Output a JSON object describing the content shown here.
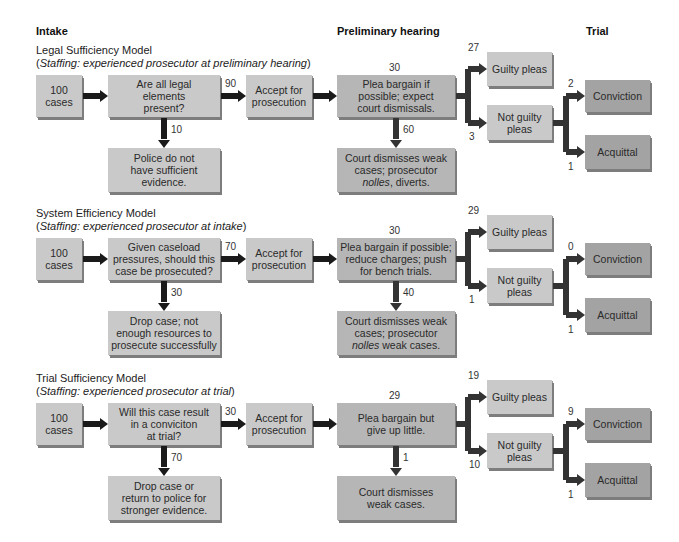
{
  "headers": {
    "intake": "Intake",
    "preliminary": "Preliminary hearing",
    "trial": "Trial"
  },
  "models": [
    {
      "title": "Legal Sufficiency Model",
      "staffing_prefix": "(",
      "staffing_label": "Staffing:",
      "staffing_text": " experienced prosecutor at preliminary hearing",
      "staffing_suffix": ")",
      "start": "100 cases",
      "question": "Are all legal elements present?",
      "question_lines": [
        "Are all legal",
        "elements",
        "present?"
      ],
      "accept_count": "90",
      "reject_count": "10",
      "reject_lines": [
        "Police do not",
        "have sufficient",
        "evidence."
      ],
      "accept_lines": [
        "Accept for",
        "prosecution"
      ],
      "plea_count": "30",
      "plea_lines": [
        "Plea bargain if",
        "possible; expect",
        "court dismissals."
      ],
      "dismiss_count": "60",
      "dismiss_lines": [
        "Court dismisses weak",
        "cases; prosecutor",
        "nolles, diverts."
      ],
      "guilty_count": "27",
      "guilty_label": "Guilty pleas",
      "notguilty_count": "3",
      "notguilty_lines": [
        "Not guilty",
        "pleas"
      ],
      "conviction_count": "2",
      "conviction_label": "Conviction",
      "acquittal_count": "1",
      "acquittal_label": "Acquittal"
    },
    {
      "title": "System Efficiency Model",
      "staffing_prefix": "(",
      "staffing_label": "Staffing:",
      "staffing_text": " experienced prosecutor at intake",
      "staffing_suffix": ")",
      "start": "100 cases",
      "question_lines": [
        "Given caseload",
        "pressures, should this",
        "case be prosecuted?"
      ],
      "accept_count": "70",
      "reject_count": "30",
      "reject_lines": [
        "Drop case; not",
        "enough resources to",
        "prosecute successfully"
      ],
      "accept_lines": [
        "Accept for",
        "prosecution"
      ],
      "plea_count": "30",
      "plea_lines": [
        "Plea bargain if possible;",
        "reduce charges; push",
        "for bench trials."
      ],
      "dismiss_count": "40",
      "dismiss_lines": [
        "Court dismisses weak",
        "cases; prosecutor",
        "nolles weak cases."
      ],
      "guilty_count": "29",
      "guilty_label": "Guilty pleas",
      "notguilty_count": "1",
      "notguilty_lines": [
        "Not guilty",
        "pleas"
      ],
      "conviction_count": "0",
      "conviction_label": "Conviction",
      "acquittal_count": "1",
      "acquittal_label": "Acquittal"
    },
    {
      "title": "Trial Sufficiency Model",
      "staffing_prefix": "(",
      "staffing_label": "Staffing:",
      "staffing_text": " experienced prosecutor at trial",
      "staffing_suffix": ")",
      "start": "100 cases",
      "question_lines": [
        "Will this case result",
        "in a conviciton",
        "at trial?"
      ],
      "accept_count": "30",
      "reject_count": "70",
      "reject_lines": [
        "Drop case or",
        "return to police for",
        "stronger evidence."
      ],
      "accept_lines": [
        "Accept for",
        "prosecution"
      ],
      "plea_count": "29",
      "plea_lines": [
        "Plea bargain but",
        "give up little."
      ],
      "dismiss_count": "1",
      "dismiss_lines": [
        "Court dismisses",
        "weak cases."
      ],
      "guilty_count": "19",
      "guilty_label": "Guilty pleas",
      "notguilty_count": "10",
      "notguilty_lines": [
        "Not guilty",
        "pleas"
      ],
      "conviction_count": "9",
      "conviction_label": "Conviction",
      "acquittal_count": "1",
      "acquittal_label": "Acquittal"
    }
  ],
  "colors": {
    "arrow": "#1a1a1a",
    "arrow_dark": "#333333",
    "box_light": "#c9c9c9",
    "box_mid": "#b6b6b6",
    "box_dark": "#a3a3a3"
  }
}
